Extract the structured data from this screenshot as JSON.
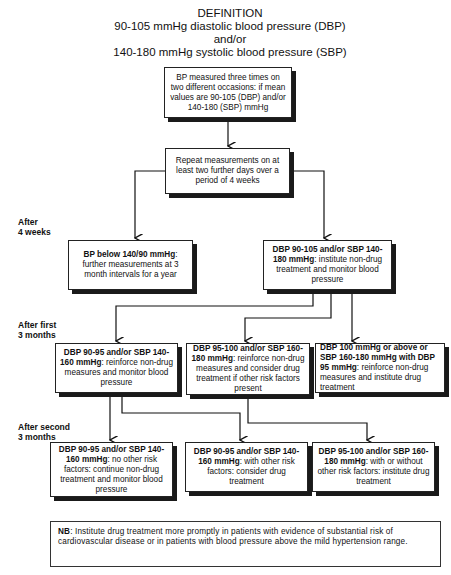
{
  "definition": {
    "heading": "DEFINITION",
    "line1": "90-105 mmHg diastolic blood pressure (DBP)",
    "line2": "and/or",
    "line3": "140-180 mmHg systolic blood pressure (SBP)"
  },
  "time_labels": {
    "after_4_weeks_l1": "After",
    "after_4_weeks_l2": "4 weeks",
    "after_first_l1": "After first",
    "after_first_l2": "3 months",
    "after_second_l1": "After second",
    "after_second_l2": "3 months"
  },
  "boxes": {
    "initial": {
      "bold": "",
      "text": "BP measured three times on two different occasions: if mean values are 90-105 (DBP) and/or 140-180 (SBP) mmHg"
    },
    "repeat": {
      "bold": "",
      "text": "Repeat measurements on at least two further days over a period of 4 weeks"
    },
    "below": {
      "bold": "BP below 140/90 mmHg",
      "text": ": further measurements at 3 month intervals for a year"
    },
    "mild": {
      "bold": "DBP 90-105 and/or SBP 140-180 mmHg",
      "text": ": institute non-drug treatment and monitor blood pressure"
    },
    "first_a": {
      "bold": "DBP 90-95 and/or SBP 140-160 mmHg",
      "text": ": reinforce non-drug measures and monitor blood pressure"
    },
    "first_b": {
      "bold": "DBP 95-100 and/or SBP 160-180 mmHg",
      "text": ": reinforce non-drug measures and consider drug treatment if other risk factors present"
    },
    "first_c": {
      "bold": "DBP 100 mmHg or above or SBP 160-180 mmHg with DBP 95 mmHg",
      "text": ": reinforce non-drug measures and institute drug treatment"
    },
    "second_a": {
      "bold": "DBP 90-95 and/or SBP 140-160 mmHg",
      "text": ": no other risk factors: continue non-drug treatment and monitor blood pressure"
    },
    "second_b": {
      "bold": "DBP 90-95 and/or SBP 140-160 mmHg",
      "text": ": with other risk factors: consider drug treatment"
    },
    "second_c": {
      "bold": "DBP 95-100 and/or SBP 160-180 mmHg",
      "text": ": with or without other risk factors: institute drug treatment"
    }
  },
  "note": {
    "bold": "NB",
    "text": ": Institute drug treatment more promptly in patients with evidence of substantial risk of cardiovascular disease or in patients with blood pressure above the mild hypertension range."
  },
  "colors": {
    "line": "#111111",
    "shadow": "#1a1a1a",
    "background": "#ffffff"
  }
}
